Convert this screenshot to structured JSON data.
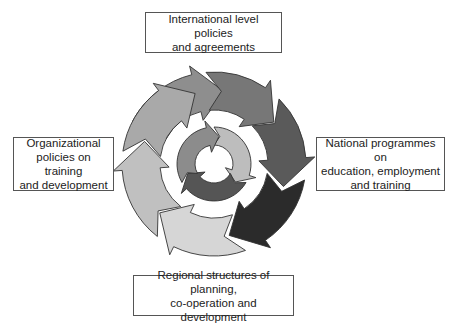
{
  "diagram": {
    "boxes": {
      "top": {
        "lines": [
          "International level policies",
          "and agreements"
        ]
      },
      "left": {
        "lines": [
          "Organizational",
          "policies on training",
          "and development"
        ]
      },
      "right": {
        "lines": [
          "National programmes on",
          "education, employment",
          "and training"
        ]
      },
      "bottom": {
        "lines": [
          "Regional structures of planning,",
          "co-operation and development"
        ]
      }
    },
    "center": {
      "x": 214,
      "y": 164
    },
    "outer_ring": {
      "r_inner": 54,
      "r_outer": 92,
      "head_extra": 9,
      "segments": [
        {
          "name": "outer-arrow-top-left",
          "start": -62,
          "end": 8,
          "color": "#8e8e8e"
        },
        {
          "name": "outer-arrow-top-right",
          "start": -5,
          "end": 55,
          "color": "#777777"
        },
        {
          "name": "outer-arrow-right",
          "start": 45,
          "end": 108,
          "color": "#5a5a5a"
        },
        {
          "name": "outer-arrow-bottom-right",
          "start": 100,
          "end": 168,
          "color": "#2b2b2b"
        },
        {
          "name": "outer-arrow-bottom",
          "start": 160,
          "end": 228,
          "color": "#d6d6d6"
        },
        {
          "name": "outer-arrow-bottom-left",
          "start": 218,
          "end": 288,
          "color": "#c0c0c0"
        },
        {
          "name": "outer-arrow-left",
          "start": 278,
          "end": 345,
          "color": "#a9a9a9"
        }
      ]
    },
    "inner_ring": {
      "r_inner": 19,
      "r_outer": 37,
      "head_extra": 7,
      "segments": [
        {
          "name": "inner-arrow-right",
          "start": 0,
          "end": 130,
          "color": "#bdbdbd"
        },
        {
          "name": "inner-arrow-bottom",
          "start": 120,
          "end": 250,
          "color": "#555555"
        },
        {
          "name": "inner-arrow-left",
          "start": 240,
          "end": 370,
          "color": "#8c8c8c"
        }
      ]
    },
    "stroke_color": "#333333"
  }
}
